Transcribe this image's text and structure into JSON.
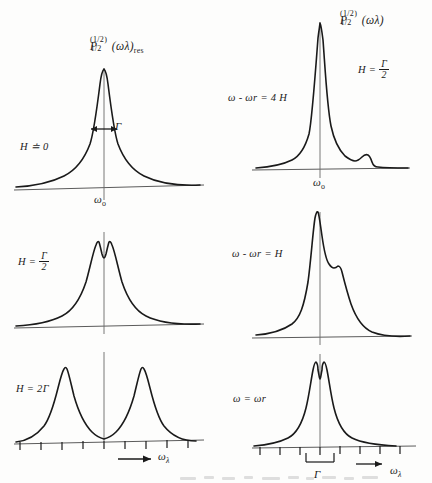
{
  "figure": {
    "kind": "hand-drawn-physics-lineshape-figure",
    "width": 432,
    "height": 483,
    "ink_color": "#1a1a1a",
    "background_color": "#fdfdfc"
  },
  "left_column": {
    "title_parts": {
      "symbol": "P",
      "superscript": "(1/2)",
      "subscript": "1/2",
      "argument": "(ωλ)",
      "trailing_subscript": "res"
    },
    "axis_label": "ωλ",
    "axis_arrow": "→",
    "center_tick_label": "ωo",
    "width_marker_label": "Γ",
    "panels": [
      {
        "id": "left-top",
        "condition": "H ≐ 0",
        "shape": "single-sharp-lorentzian",
        "has_width_marker": true,
        "has_center_label": true
      },
      {
        "id": "left-middle",
        "condition_prefix": "H =",
        "condition_numerator": "Γ",
        "condition_denominator": "2",
        "shape": "narrow-symmetric-doublet",
        "has_width_marker": false,
        "has_center_label": false
      },
      {
        "id": "left-bottom",
        "condition": "H = 2Γ",
        "shape": "wide-symmetric-doublet",
        "has_ticks": true,
        "has_axis_label": true
      }
    ]
  },
  "right_column": {
    "title_parts": {
      "symbol": "P",
      "superscript": "(1/2)",
      "subscript": "1/2",
      "argument": "(ωλ)"
    },
    "global_condition_prefix": "H =",
    "global_condition_numerator": "Γ",
    "global_condition_denominator": "2",
    "axis_label": "ωλ",
    "axis_arrow": "→",
    "center_tick_label": "ωo",
    "width_marker_label": "Γ",
    "panels": [
      {
        "id": "right-top",
        "condition": "ω - ωr = 4 H",
        "shape": "tall-peak-with-right-shoulder",
        "has_center_label": true
      },
      {
        "id": "right-middle",
        "condition": "ω - ωr = H",
        "shape": "tall-peak-with-right-step",
        "has_center_label": false
      },
      {
        "id": "right-bottom",
        "condition": "ω = ωr",
        "shape": "symmetric-doublet",
        "has_ticks": true,
        "has_axis_label": true,
        "has_width_bracket": true
      }
    ]
  }
}
